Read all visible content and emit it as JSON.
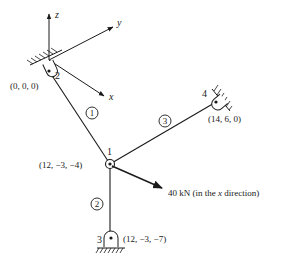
{
  "diagram": {
    "type": "space-truss",
    "axes": {
      "z_label": "z",
      "y_label": "y",
      "x_label": "x"
    },
    "nodes": [
      {
        "id": "1",
        "label": "1",
        "coords": "(12, −3, −4)"
      },
      {
        "id": "2",
        "label": "2",
        "coords": "(0, 0, 0)"
      },
      {
        "id": "3",
        "label": "3",
        "coords": "(12, −3, −7)"
      },
      {
        "id": "4",
        "label": "4",
        "coords": "(14, 6, 0)"
      }
    ],
    "elements": [
      {
        "id": "1",
        "label": "1",
        "from": "2",
        "to": "1"
      },
      {
        "id": "2",
        "label": "2",
        "from": "1",
        "to": "3"
      },
      {
        "id": "3",
        "label": "3",
        "from": "1",
        "to": "4"
      }
    ],
    "load": {
      "label": "40 kN (in the ",
      "axis": "x",
      "suffix": " direction)"
    },
    "colors": {
      "ink": "#1a1a1a",
      "background": "#ffffff"
    }
  }
}
